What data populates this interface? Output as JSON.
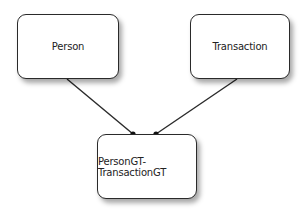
{
  "diagram": {
    "type": "entity-relationship",
    "nodes": [
      {
        "id": "person",
        "label": "Person"
      },
      {
        "id": "transaction",
        "label": "Transaction"
      },
      {
        "id": "join",
        "label": "PersonGT-TransactionGT"
      }
    ],
    "edges": [
      {
        "from": "person",
        "to": "join",
        "end_marker": "dot"
      },
      {
        "from": "transaction",
        "to": "join",
        "end_marker": "dot"
      }
    ],
    "colors": {
      "stroke": "#2a2a2a",
      "fill": "#ffffff",
      "text": "#222222"
    }
  }
}
